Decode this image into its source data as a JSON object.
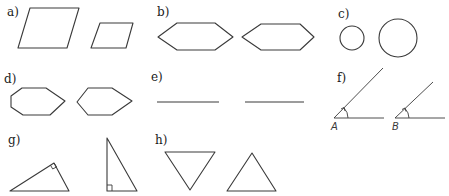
{
  "figure": {
    "background": "#ffffff",
    "stroke_color": "#3a3a3a",
    "parts": [
      {
        "id": "a",
        "label": "a)",
        "description": "two parallelograms of different size"
      },
      {
        "id": "b",
        "label": "b)",
        "description": "two congruent hexagons"
      },
      {
        "id": "c",
        "label": "c)",
        "description": "two circles of different radius"
      },
      {
        "id": "d",
        "label": "d)",
        "description": "a heptagon and a hexagon"
      },
      {
        "id": "e",
        "label": "e)",
        "description": "two line segments"
      },
      {
        "id": "f",
        "label": "f)",
        "description": "two angles with vertices A and B",
        "vertex_labels": [
          "A",
          "B"
        ]
      },
      {
        "id": "g",
        "label": "g)",
        "description": "two right triangles"
      },
      {
        "id": "h",
        "label": "h)",
        "description": "two equilateral triangles, one inverted"
      }
    ]
  }
}
